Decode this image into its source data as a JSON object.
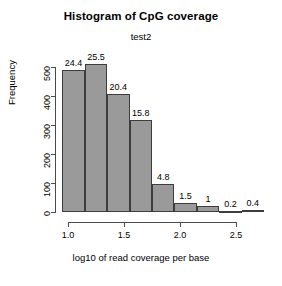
{
  "chart_data": {
    "type": "bar",
    "title": "Histogram of CpG coverage",
    "subtitle": "test2",
    "xlabel": "log10 of read coverage per base",
    "ylabel": "Frequency",
    "grid": false,
    "legend": false,
    "xlim": [
      0.95,
      2.75
    ],
    "ylim": [
      0,
      530
    ],
    "xticks": [
      "1.0",
      "1.5",
      "2.0",
      "2.5"
    ],
    "xtick_values": [
      1.0,
      1.5,
      2.0,
      2.5
    ],
    "yticks": [
      "0",
      "100",
      "200",
      "300",
      "400",
      "500"
    ],
    "ytick_values": [
      0,
      100,
      200,
      300,
      400,
      500
    ],
    "bin_width": 0.2,
    "bin_edges": [
      0.95,
      1.15,
      1.35,
      1.55,
      1.75,
      1.95,
      2.15,
      2.35,
      2.55,
      2.75
    ],
    "categories": [
      "0.95-1.15",
      "1.15-1.35",
      "1.35-1.55",
      "1.55-1.75",
      "1.75-1.95",
      "1.95-2.15",
      "2.15-2.35",
      "2.35-2.55",
      "2.55-2.75"
    ],
    "values": [
      488,
      510,
      408,
      316,
      96,
      30,
      20,
      4,
      8
    ],
    "data_labels": [
      "24.4",
      "25.5",
      "20.4",
      "15.8",
      "4.8",
      "1.5",
      "1",
      "0.2",
      "0.4"
    ],
    "bar_fill_color": "#9a9a9a",
    "bar_border_color": "#3d3d3d",
    "axis_color": "#4a4a4a",
    "background_color": "#ffffff"
  }
}
